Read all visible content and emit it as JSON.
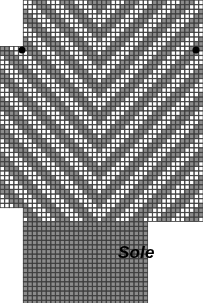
{
  "chart_title": "Sole",
  "label": {
    "sole": "Sole",
    "x": 118,
    "y": 243
  },
  "colors": {
    "filled": "#8c8c8c",
    "empty": "#ffffff",
    "grid": "#3a3a3a",
    "marker": "#000000",
    "background": "#ffffff"
  },
  "grid": {
    "cell": 4.62,
    "origin_x": 0.0,
    "origin_y": 0.0,
    "cols": 44,
    "rows": 66,
    "line_width": 0.8
  },
  "markers": [
    {
      "name": "left-marker",
      "x": 22,
      "y": 50
    },
    {
      "name": "right-marker",
      "x": 196,
      "y": 50
    }
  ],
  "chart_data": {
    "type": "heatmap",
    "title": "Sole",
    "xlabel": "",
    "ylabel": "",
    "legend": [
      "filled",
      "empty"
    ],
    "regions": [
      {
        "name": "upper-body",
        "col_start": 5,
        "col_end": 43,
        "row_start": 0,
        "row_end": 10,
        "pattern": "chevron"
      },
      {
        "name": "full-body",
        "col_start": 0,
        "col_end": 43,
        "row_start": 10,
        "row_end": 35,
        "pattern": "chevron"
      },
      {
        "name": "left-tab",
        "col_start": 0,
        "col_end": 9,
        "row_start": 35,
        "row_end": 44,
        "pattern": "chevron"
      },
      {
        "name": "right-body",
        "col_start": 5,
        "col_end": 43,
        "row_start": 35,
        "row_end": 47,
        "pattern": "chevron"
      },
      {
        "name": "sole-block",
        "col_start": 5,
        "col_end": 31,
        "row_start": 48,
        "row_end": 65,
        "pattern": "solid"
      }
    ],
    "chevron": {
      "apex_col": 21,
      "band_period": 6,
      "filled_band_width": 3,
      "slope": 1
    }
  }
}
